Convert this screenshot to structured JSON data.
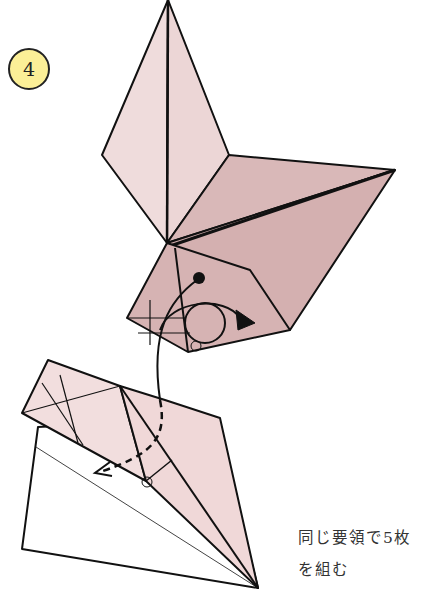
{
  "step": {
    "number": "4"
  },
  "caption": {
    "line1": "同じ要領で5枚",
    "line2": "を組む"
  },
  "colors": {
    "paper_light": "#f0dede",
    "paper_mid": "#dcbdbd",
    "paper_dark": "#d4b0b0",
    "badge": "#fbef97",
    "line": "#111111"
  },
  "symbols": {
    "dot": "hold-point",
    "circle_markers": [
      "pivot-upper",
      "pivot-lower"
    ],
    "arrows": [
      "insert-arrow",
      "rotate-arrow"
    ]
  }
}
